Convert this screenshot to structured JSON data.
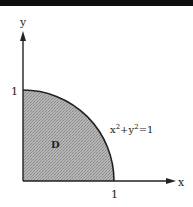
{
  "diagram": {
    "axes": {
      "x_label": "x",
      "y_label": "y",
      "x_tick": "1",
      "y_tick": "1"
    },
    "region": {
      "label": "D",
      "fill": "#a8a8a8"
    },
    "curve": {
      "equation_base_x": "x",
      "equation_exp_x": "2",
      "equation_plus": "+",
      "equation_base_y": "y",
      "equation_exp_y": "2",
      "equation_rhs": "=1",
      "color": "#222222"
    },
    "colors": {
      "ink": "#222222",
      "top_bar": "#0d0d0d",
      "background": "#ffffff"
    }
  }
}
